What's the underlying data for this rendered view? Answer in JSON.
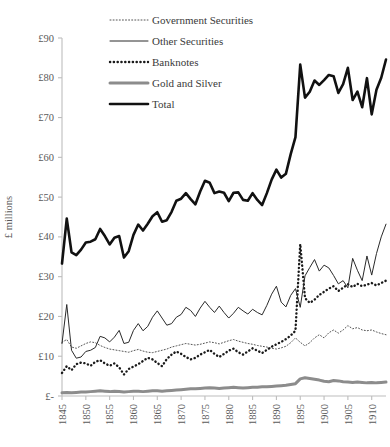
{
  "chart_data": {
    "type": "line",
    "title": "",
    "xlabel": "",
    "ylabel": "£ millions",
    "xlim": [
      1845,
      1913
    ],
    "ylim": [
      0,
      90
    ],
    "grid": false,
    "legend_position": "top-center",
    "y_ticks": [
      "£-",
      "£10",
      "£20",
      "£30",
      "£40",
      "£50",
      "£60",
      "£70",
      "£80",
      "£90"
    ],
    "y_tick_values": [
      0,
      10,
      20,
      30,
      40,
      50,
      60,
      70,
      80,
      90
    ],
    "x_ticks": [
      "1845",
      "1850",
      "1855",
      "1860",
      "1865",
      "1870",
      "1875",
      "1880",
      "1885",
      "1890",
      "1895",
      "1900",
      "1905",
      "1910"
    ],
    "x_tick_values": [
      1845,
      1850,
      1855,
      1860,
      1865,
      1870,
      1875,
      1880,
      1885,
      1890,
      1895,
      1900,
      1905,
      1910
    ],
    "x": [
      1845,
      1846,
      1847,
      1848,
      1849,
      1850,
      1851,
      1852,
      1853,
      1854,
      1855,
      1856,
      1857,
      1858,
      1859,
      1860,
      1861,
      1862,
      1863,
      1864,
      1865,
      1866,
      1867,
      1868,
      1869,
      1870,
      1871,
      1872,
      1873,
      1874,
      1875,
      1876,
      1877,
      1878,
      1879,
      1880,
      1881,
      1882,
      1883,
      1884,
      1885,
      1886,
      1887,
      1888,
      1889,
      1890,
      1891,
      1892,
      1893,
      1894,
      1895,
      1896,
      1897,
      1898,
      1899,
      1900,
      1901,
      1902,
      1903,
      1904,
      1905,
      1906,
      1907,
      1908,
      1909,
      1910,
      1911,
      1912,
      1913
    ],
    "series": [
      {
        "name": "Government Securities",
        "style": "fine-dotted",
        "color": "#555555",
        "values": [
          13.5,
          14.2,
          12.3,
          12.0,
          12.6,
          13.2,
          13.6,
          13.4,
          12.7,
          12.2,
          11.8,
          11.6,
          11.4,
          11.2,
          11.0,
          11.4,
          11.7,
          11.3,
          11.0,
          10.9,
          11.2,
          11.5,
          11.8,
          12.3,
          12.6,
          12.9,
          13.2,
          13.0,
          12.8,
          13.0,
          13.3,
          13.6,
          13.4,
          13.1,
          13.5,
          13.9,
          14.2,
          13.8,
          13.5,
          13.2,
          13.0,
          12.7,
          12.5,
          12.3,
          12.0,
          11.8,
          12.1,
          12.5,
          13.4,
          14.6,
          13.5,
          12.6,
          13.4,
          14.6,
          15.4,
          14.6,
          15.9,
          16.6,
          15.8,
          16.6,
          17.7,
          16.9,
          17.2,
          16.6,
          16.4,
          16.6,
          16.1,
          15.7,
          15.4
        ]
      },
      {
        "name": "Other Securities",
        "style": "thin-solid",
        "color": "#2a2a2a",
        "values": [
          13.2,
          23.0,
          11.5,
          9.5,
          9.8,
          11.2,
          11.5,
          12.2,
          15.0,
          14.6,
          13.6,
          14.8,
          16.5,
          13.2,
          13.5,
          16.5,
          18.2,
          16.4,
          17.5,
          19.8,
          21.4,
          19.6,
          17.8,
          18.2,
          19.8,
          20.5,
          22.3,
          21.5,
          20.0,
          22.1,
          23.8,
          22.3,
          21.0,
          22.6,
          21.0,
          19.6,
          20.8,
          22.3,
          21.4,
          20.6,
          21.8,
          21.0,
          20.4,
          22.8,
          25.6,
          27.6,
          23.6,
          22.4,
          25.3,
          27.0,
          22.3,
          30.2,
          32.3,
          34.3,
          31.4,
          32.9,
          32.2,
          30.3,
          28.2,
          29.0,
          27.2,
          34.6,
          31.6,
          29.0,
          35.2,
          30.4,
          35.8,
          40.0,
          43.2
        ]
      },
      {
        "name": "Banknotes",
        "style": "bold-dotted",
        "color": "#1a1a1a",
        "values": [
          5.8,
          7.5,
          6.5,
          8.0,
          8.4,
          8.2,
          7.6,
          8.6,
          9.0,
          8.2,
          7.6,
          8.2,
          7.2,
          5.4,
          6.8,
          7.4,
          8.0,
          8.8,
          9.6,
          9.2,
          8.3,
          7.5,
          9.3,
          10.4,
          11.2,
          10.6,
          9.8,
          9.2,
          9.6,
          10.4,
          11.0,
          11.6,
          10.6,
          9.8,
          10.6,
          11.4,
          11.9,
          11.0,
          10.4,
          11.2,
          12.0,
          11.4,
          10.8,
          11.6,
          12.4,
          13.0,
          13.6,
          14.3,
          15.2,
          16.4,
          38.2,
          24.6,
          23.4,
          24.2,
          25.4,
          26.2,
          27.0,
          27.6,
          26.4,
          27.2,
          28.1,
          27.4,
          28.2,
          27.6,
          28.0,
          28.4,
          27.8,
          28.4,
          29.0
        ]
      },
      {
        "name": "Gold and Silver",
        "style": "thick-gray",
        "color": "#8c8c8c",
        "values": [
          0.8,
          0.9,
          0.8,
          0.9,
          1.0,
          1.0,
          1.1,
          1.2,
          1.3,
          1.2,
          1.1,
          1.2,
          1.1,
          1.0,
          1.1,
          1.2,
          1.2,
          1.1,
          1.2,
          1.3,
          1.3,
          1.2,
          1.3,
          1.4,
          1.5,
          1.6,
          1.7,
          1.8,
          1.8,
          1.9,
          2.0,
          2.1,
          2.0,
          1.9,
          2.0,
          2.1,
          2.2,
          2.1,
          2.0,
          2.1,
          2.2,
          2.2,
          2.3,
          2.3,
          2.4,
          2.5,
          2.6,
          2.7,
          2.9,
          3.1,
          4.3,
          4.6,
          4.4,
          4.2,
          4.0,
          3.7,
          3.6,
          3.9,
          3.8,
          3.6,
          3.5,
          3.4,
          3.5,
          3.4,
          3.3,
          3.4,
          3.3,
          3.4,
          3.5
        ]
      },
      {
        "name": "Total",
        "style": "thick-black",
        "color": "#111111",
        "values": [
          33.3,
          44.6,
          36.1,
          35.4,
          36.8,
          38.6,
          38.8,
          39.4,
          42.0,
          40.2,
          38.1,
          39.8,
          40.2,
          34.8,
          36.4,
          40.5,
          43.1,
          41.6,
          43.3,
          45.2,
          46.2,
          43.8,
          44.2,
          46.3,
          49.1,
          49.6,
          51.0,
          49.5,
          48.2,
          51.4,
          54.1,
          53.6,
          51.0,
          51.4,
          51.1,
          49.0,
          51.1,
          51.2,
          49.3,
          49.1,
          51.0,
          49.3,
          48.0,
          51.0,
          54.4,
          56.9,
          54.9,
          55.9,
          60.8,
          65.1,
          83.3,
          75.0,
          76.5,
          79.3,
          78.2,
          79.4,
          80.7,
          80.4,
          76.2,
          78.4,
          82.5,
          74.4,
          76.5,
          72.6,
          79.9,
          70.8,
          77.0,
          80.0,
          84.6
        ]
      }
    ]
  },
  "legend": {
    "items": [
      {
        "label": "Government Securities",
        "key": "fine-dotted"
      },
      {
        "label": "Other Securities",
        "key": "thin-solid"
      },
      {
        "label": "Banknotes",
        "key": "bold-dotted"
      },
      {
        "label": "Gold and Silver",
        "key": "thick-gray"
      },
      {
        "label": "Total",
        "key": "thick-black"
      }
    ]
  },
  "colors": {
    "background": "#ffffff",
    "axis": "#bdbdbd",
    "tick_text": "#5a5a5a"
  }
}
